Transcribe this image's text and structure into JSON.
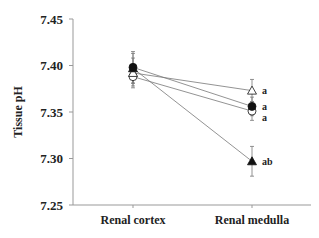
{
  "chart_data": {
    "type": "line",
    "title": "",
    "xlabel": "",
    "ylabel": "Tissue pH",
    "categories": [
      "Renal cortex",
      "Renal medulla"
    ],
    "ylim": [
      7.25,
      7.45
    ],
    "yticks": [
      "7.25",
      "7.30",
      "7.35",
      "7.40",
      "7.45"
    ],
    "ytick_values": [
      7.25,
      7.3,
      7.35,
      7.4,
      7.45
    ],
    "grid": false,
    "legend": "none",
    "series": [
      {
        "name": "open-triangle",
        "marker": "triangle-open",
        "values": [
          7.392,
          7.373
        ],
        "err": [
          0.016,
          0.012
        ],
        "annotation": "a"
      },
      {
        "name": "filled-circle",
        "marker": "circle-filled",
        "values": [
          7.398,
          7.356
        ],
        "err": [
          0.017,
          0.01
        ],
        "annotation": "a"
      },
      {
        "name": "open-circle",
        "marker": "circle-open",
        "values": [
          7.388,
          7.351
        ],
        "err": [
          0.01,
          0.01
        ],
        "annotation": "a"
      },
      {
        "name": "filled-triangle",
        "marker": "triangle-filled",
        "values": [
          7.397,
          7.297
        ],
        "err": [
          0.016,
          0.016
        ],
        "annotation": "ab"
      }
    ]
  }
}
